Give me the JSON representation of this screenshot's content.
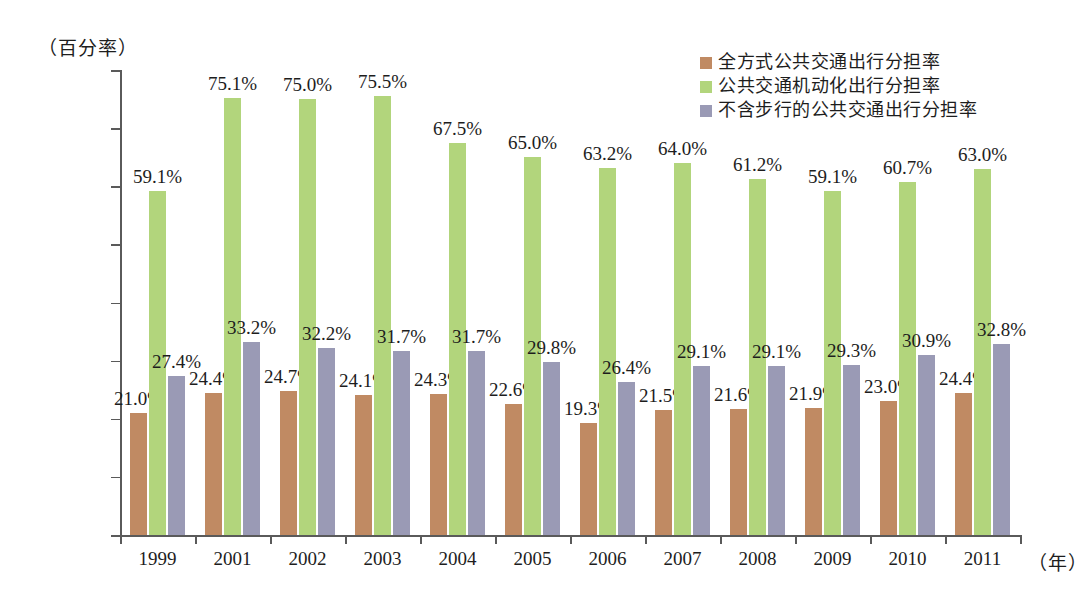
{
  "axis": {
    "y_unit_caption": "（百分率）",
    "x_unit_caption": "（年）",
    "y_ticks": [
      "0.0%",
      "10.0%",
      "20.0%",
      "30.0%",
      "40.0%",
      "50.0%",
      "60.0%",
      "70.0%",
      "80.0%"
    ]
  },
  "legend": {
    "items": [
      {
        "label": "全方式公共交通出行分担率",
        "color": "#c08a63"
      },
      {
        "label": "公共交通机动化出行分担率",
        "color": "#b2d57c"
      },
      {
        "label": "不含步行的公共交通出行分担率",
        "color": "#9a9ab5"
      }
    ]
  },
  "chart_data": {
    "type": "bar",
    "title": "",
    "xlabel": "（年）",
    "ylabel": "（百分率）",
    "ylim": [
      0,
      80
    ],
    "ytick_step": 10,
    "grid": false,
    "legend_position": "top-right",
    "categories": [
      "1999",
      "2001",
      "2002",
      "2003",
      "2004",
      "2005",
      "2006",
      "2007",
      "2008",
      "2009",
      "2010",
      "2011"
    ],
    "series": [
      {
        "name": "全方式公共交通出行分担率",
        "color": "#c08a63",
        "values": [
          21.0,
          24.4,
          24.7,
          24.1,
          24.3,
          22.6,
          19.3,
          21.5,
          21.6,
          21.9,
          23.0,
          24.4
        ],
        "labels": [
          "21.0%",
          "24.4%",
          "24.7%",
          "24.1%",
          "24.3%",
          "22.6%",
          "19.3%",
          "21.5%",
          "21.6%",
          "21.9%",
          "23.0%",
          "24.4%"
        ]
      },
      {
        "name": "公共交通机动化出行分担率",
        "color": "#b2d57c",
        "values": [
          59.1,
          75.1,
          75.0,
          75.5,
          67.5,
          65.0,
          63.2,
          64.0,
          61.2,
          59.1,
          60.7,
          63.0
        ],
        "labels": [
          "59.1%",
          "75.1%",
          "75.0%",
          "75.5%",
          "67.5%",
          "65.0%",
          "63.2%",
          "64.0%",
          "61.2%",
          "59.1%",
          "60.7%",
          "63.0%"
        ]
      },
      {
        "name": "不含步行的公共交通出行分担率",
        "color": "#9a9ab5",
        "values": [
          27.4,
          33.2,
          32.2,
          31.7,
          31.7,
          29.8,
          26.4,
          29.1,
          29.1,
          29.3,
          30.9,
          32.8
        ],
        "labels": [
          "27.4%",
          "33.2%",
          "32.2%",
          "31.7%",
          "31.7%",
          "29.8%",
          "26.4%",
          "29.1%",
          "29.1%",
          "29.3%",
          "30.9%",
          "32.8%"
        ]
      }
    ]
  }
}
